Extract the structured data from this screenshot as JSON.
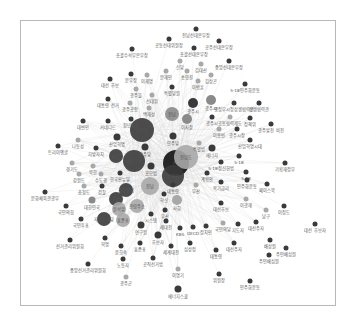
{
  "diagram": {
    "type": "network",
    "colors": {
      "dark": "#3a3a3a",
      "mid": "#8a8a8a",
      "light": "#a8a8a8",
      "black": "#111111",
      "edge": "#dcdcdc",
      "frame": "#b8b8b8"
    },
    "nodes": [
      {
        "id": "n1",
        "label": "전남선대본부장",
        "x": 196,
        "y": 29,
        "r": 2.5,
        "c": "dark"
      },
      {
        "id": "n2",
        "label": "공동선대위원장",
        "x": 169,
        "y": 39,
        "r": 2.5,
        "c": "dark"
      },
      {
        "id": "n3",
        "label": "공주선대본부장",
        "x": 219,
        "y": 41,
        "r": 2.5,
        "c": "dark"
      },
      {
        "id": "n4",
        "label": "총괄수석부본부장",
        "x": 132,
        "y": 49,
        "r": 2.5,
        "c": "dark"
      },
      {
        "id": "n5",
        "label": "총괄선대본부장",
        "x": 194,
        "y": 48,
        "r": 2.5,
        "c": "dark"
      },
      {
        "id": "n6",
        "label": "중앙선대본부장",
        "x": 229,
        "y": 61,
        "r": 2.5,
        "c": "dark"
      },
      {
        "id": "n7",
        "label": "신당",
        "x": 180,
        "y": 61,
        "r": 2.5,
        "c": "light"
      },
      {
        "id": "n8",
        "label": "김대산",
        "x": 201,
        "y": 64,
        "r": 2.5,
        "c": "light"
      },
      {
        "id": "n9",
        "label": "문재인",
        "x": 166,
        "y": 71,
        "r": 2.5,
        "c": "light"
      },
      {
        "id": "n10",
        "label": "송영길",
        "x": 187,
        "y": 71,
        "r": 2.5,
        "c": "light"
      },
      {
        "id": "n11",
        "label": "김상곤",
        "x": 211,
        "y": 75,
        "r": 2.5,
        "c": "light"
      },
      {
        "id": "n12",
        "label": "문부장",
        "x": 131,
        "y": 74,
        "r": 2.5,
        "c": "dark"
      },
      {
        "id": "n13",
        "label": "이재명",
        "x": 147,
        "y": 75,
        "r": 2.5,
        "c": "light"
      },
      {
        "id": "n14",
        "label": "대선 후보",
        "x": 110,
        "y": 79,
        "r": 2.5,
        "c": "dark"
      },
      {
        "id": "n15",
        "label": "이병훈",
        "x": 198,
        "y": 81,
        "r": 2.5,
        "c": "light"
      },
      {
        "id": "n16",
        "label": "특별당원",
        "x": 172,
        "y": 87,
        "r": 2.5,
        "c": "dark"
      },
      {
        "id": "n17",
        "label": "5·18민주화운동",
        "x": 245,
        "y": 84,
        "r": 2.5,
        "c": "dark"
      },
      {
        "id": "n18",
        "label": "광주을",
        "x": 136,
        "y": 89,
        "r": 2.5,
        "c": "light"
      },
      {
        "id": "n19",
        "label": "대통령 선거",
        "x": 108,
        "y": 99,
        "r": 2.5,
        "c": "dark"
      },
      {
        "id": "n20",
        "label": "광주공항",
        "x": 130,
        "y": 103,
        "r": 2.5,
        "c": "light"
      },
      {
        "id": "n21",
        "label": "선대위",
        "x": 152,
        "y": 95,
        "r": 2.5,
        "c": "light"
      },
      {
        "id": "n22",
        "label": "광주시",
        "x": 193,
        "y": 103,
        "r": 5,
        "c": "dark"
      },
      {
        "id": "n23",
        "label": "광주시",
        "x": 211,
        "y": 100,
        "r": 5,
        "c": "mid"
      },
      {
        "id": "n24",
        "label": "행정부시장상생협력관",
        "x": 234,
        "y": 103,
        "r": 2.5,
        "c": "dark"
      },
      {
        "id": "n25",
        "label": "상생협력관",
        "x": 259,
        "y": 103,
        "r": 2.5,
        "c": "dark"
      },
      {
        "id": "n26",
        "label": "백재성",
        "x": 149,
        "y": 108,
        "r": 2.5,
        "c": "light"
      },
      {
        "id": "n27",
        "label": "전남",
        "x": 172,
        "y": 114,
        "r": 7,
        "c": "mid"
      },
      {
        "id": "n28",
        "label": "이사장",
        "x": 187,
        "y": 119,
        "r": 5,
        "c": "mid"
      },
      {
        "id": "n29",
        "label": "광주시",
        "x": 212,
        "y": 117,
        "r": 2.5,
        "c": "dark"
      },
      {
        "id": "n30",
        "label": "공동협력제도",
        "x": 230,
        "y": 117,
        "r": 2.5,
        "c": "light"
      },
      {
        "id": "n31",
        "label": "정책위",
        "x": 250,
        "y": 118,
        "r": 2.5,
        "c": "dark"
      },
      {
        "id": "n32",
        "label": "광주발전 비전",
        "x": 271,
        "y": 124,
        "r": 2.5,
        "c": "dark"
      },
      {
        "id": "n33",
        "label": "대변인",
        "x": 83,
        "y": 121,
        "r": 2.5,
        "c": "dark"
      },
      {
        "id": "n34",
        "label": "커네디드",
        "x": 108,
        "y": 121,
        "r": 2.5,
        "c": "dark"
      },
      {
        "id": "n35",
        "label": "청년위원",
        "x": 131,
        "y": 119,
        "r": 2.5,
        "c": "dark"
      },
      {
        "id": "n36",
        "label": "이용섭",
        "x": 142,
        "y": 130,
        "r": 12,
        "c": "dark"
      },
      {
        "id": "n37",
        "label": "광주시장",
        "x": 237,
        "y": 129,
        "r": 2.5,
        "c": "dark"
      },
      {
        "id": "n38",
        "label": "이용빈",
        "x": 219,
        "y": 129,
        "r": 2.5,
        "c": "light"
      },
      {
        "id": "n39",
        "label": "민주당",
        "x": 173,
        "y": 136,
        "r": 3.5,
        "c": "dark"
      },
      {
        "id": "n40",
        "label": "산업혁명시대",
        "x": 250,
        "y": 140,
        "r": 2.5,
        "c": "dark"
      },
      {
        "id": "n41",
        "label": "나동성",
        "x": 78,
        "y": 140,
        "r": 2.5,
        "c": "light"
      },
      {
        "id": "n42",
        "label": "산업혁명",
        "x": 117,
        "y": 137,
        "r": 3.5,
        "c": "dark"
      },
      {
        "id": "n43",
        "label": "민주당",
        "x": 145,
        "y": 147,
        "r": 3.5,
        "c": "dark"
      },
      {
        "id": "n44",
        "label": "특별법",
        "x": 199,
        "y": 143,
        "r": 2.5,
        "c": "light"
      },
      {
        "id": "n45",
        "label": "트리이앵글",
        "x": 58,
        "y": 146,
        "r": 2.5,
        "c": "dark"
      },
      {
        "id": "n46",
        "label": "지방자치",
        "x": 96,
        "y": 148,
        "r": 2.5,
        "c": "dark"
      },
      {
        "id": "n47",
        "label": "에너지",
        "x": 212,
        "y": 148,
        "r": 3.5,
        "c": "dark"
      },
      {
        "id": "n48",
        "label": "대선",
        "x": 116,
        "y": 156,
        "r": 7,
        "c": "dark"
      },
      {
        "id": "n49",
        "label": "대선후보",
        "x": 134,
        "y": 161,
        "r": 11,
        "c": "dark"
      },
      {
        "id": "n50",
        "label": "광주",
        "x": 176,
        "y": 163,
        "r": 13,
        "c": "black"
      },
      {
        "id": "n51",
        "label": "전남도",
        "x": 186,
        "y": 157,
        "r": 12,
        "c": "light"
      },
      {
        "id": "n52",
        "label": "공모법",
        "x": 151,
        "y": 166,
        "r": 3.5,
        "c": "dark"
      },
      {
        "id": "n53",
        "label": "5·18",
        "x": 239,
        "y": 156,
        "r": 2.5,
        "c": "dark"
      },
      {
        "id": "n54",
        "label": "5·18정신헌법",
        "x": 221,
        "y": 162,
        "r": 2.5,
        "c": "dark"
      },
      {
        "id": "n55",
        "label": "기획재정부",
        "x": 285,
        "y": 163,
        "r": 2.5,
        "c": "dark"
      },
      {
        "id": "n56",
        "label": "경기도",
        "x": 72,
        "y": 163,
        "r": 2.5,
        "c": "light"
      },
      {
        "id": "n57",
        "label": "북한",
        "x": 93,
        "y": 166,
        "r": 2.5,
        "c": "light"
      },
      {
        "id": "n58",
        "label": "강원도",
        "x": 79,
        "y": 174,
        "r": 2.5,
        "c": "light"
      },
      {
        "id": "n59",
        "label": "수도권",
        "x": 101,
        "y": 174,
        "r": 2.5,
        "c": "light"
      },
      {
        "id": "n60",
        "label": "한국판뉴딜",
        "x": 120,
        "y": 173,
        "r": 2.5,
        "c": "dark"
      },
      {
        "id": "n61",
        "label": "동해안",
        "x": 173,
        "y": 176,
        "r": 11,
        "c": "dark"
      },
      {
        "id": "n62",
        "label": "계획안",
        "x": 207,
        "y": 173,
        "r": 2.5,
        "c": "dark"
      },
      {
        "id": "n63",
        "label": "5·18",
        "x": 246,
        "y": 172,
        "r": 2.5,
        "c": "dark"
      },
      {
        "id": "n64",
        "label": "충청도",
        "x": 84,
        "y": 186,
        "r": 2.5,
        "c": "light"
      },
      {
        "id": "n65",
        "label": "검찰",
        "x": 102,
        "y": 186,
        "r": 2.5,
        "c": "dark"
      },
      {
        "id": "n66",
        "label": "공정경제",
        "x": 126,
        "y": 190,
        "r": 7,
        "c": "dark"
      },
      {
        "id": "n67",
        "label": "전남",
        "x": 150,
        "y": 186,
        "r": 9,
        "c": "light"
      },
      {
        "id": "n68",
        "label": "대통령",
        "x": 173,
        "y": 185,
        "r": 2.5,
        "c": "dark"
      },
      {
        "id": "n69",
        "label": "부산",
        "x": 196,
        "y": 185,
        "r": 2.5,
        "c": "light"
      },
      {
        "id": "n70",
        "label": "복기금리",
        "x": 221,
        "y": 182,
        "r": 2.5,
        "c": "dark"
      },
      {
        "id": "n71",
        "label": "민주화운동",
        "x": 247,
        "y": 180,
        "r": 2.5,
        "c": "dark"
      },
      {
        "id": "n72",
        "label": "페이스북",
        "x": 267,
        "y": 184,
        "r": 2.5,
        "c": "dark"
      },
      {
        "id": "n73",
        "label": "문화체육관광부",
        "x": 45,
        "y": 192,
        "r": 2.5,
        "c": "dark"
      },
      {
        "id": "n74",
        "label": "대한민국",
        "x": 92,
        "y": 200,
        "r": 3.5,
        "c": "mid"
      },
      {
        "id": "n75",
        "label": "국정",
        "x": 116,
        "y": 199,
        "r": 7,
        "c": "dark"
      },
      {
        "id": "n76",
        "label": "관람주소",
        "x": 137,
        "y": 206,
        "r": 7,
        "c": "light"
      },
      {
        "id": "n77",
        "label": "혁신",
        "x": 164,
        "y": 194,
        "r": 2.5,
        "c": "dark"
      },
      {
        "id": "n78",
        "label": "사회",
        "x": 177,
        "y": 200,
        "r": 5,
        "c": "light"
      },
      {
        "id": "n79",
        "label": "대선후보",
        "x": 221,
        "y": 203,
        "r": 2.5,
        "c": "dark"
      },
      {
        "id": "n80",
        "label": "이광재",
        "x": 246,
        "y": 199,
        "r": 2.5,
        "c": "light"
      },
      {
        "id": "n81",
        "label": "국민의힘",
        "x": 66,
        "y": 206,
        "r": 2.5,
        "c": "dark"
      },
      {
        "id": "n82",
        "label": "윤석열",
        "x": 119,
        "y": 209,
        "r": 7,
        "c": "light"
      },
      {
        "id": "n83",
        "label": "부산",
        "x": 165,
        "y": 210,
        "r": 2.5,
        "c": "dark"
      },
      {
        "id": "n84",
        "label": "남구",
        "x": 266,
        "y": 210,
        "r": 2.5,
        "c": "light"
      },
      {
        "id": "n85",
        "label": "이정도",
        "x": 284,
        "y": 206,
        "r": 2.5,
        "c": "dark"
      },
      {
        "id": "n86",
        "label": "국민투표",
        "x": 81,
        "y": 219,
        "r": 2.5,
        "c": "dark"
      },
      {
        "id": "n87",
        "label": "자유한국당",
        "x": 104,
        "y": 219,
        "r": 7,
        "c": "dark"
      },
      {
        "id": "n88",
        "label": "홍준표",
        "x": 123,
        "y": 220,
        "r": 7,
        "c": "light"
      },
      {
        "id": "n89",
        "label": "시스템",
        "x": 151,
        "y": 214,
        "r": 2.5,
        "c": "dark"
      },
      {
        "id": "n90",
        "label": "세대전",
        "x": 166,
        "y": 221,
        "r": 2.5,
        "c": "dark"
      },
      {
        "id": "n91",
        "label": "국민의당",
        "x": 223,
        "y": 223,
        "r": 2.5,
        "c": "light"
      },
      {
        "id": "n92",
        "label": "지도자",
        "x": 238,
        "y": 224,
        "r": 2.5,
        "c": "dark"
      },
      {
        "id": "n93",
        "label": "대선주자",
        "x": 256,
        "y": 222,
        "r": 2.5,
        "c": "dark"
      },
      {
        "id": "n94",
        "label": "대선 후보자",
        "x": 315,
        "y": 224,
        "r": 2.5,
        "c": "dark"
      },
      {
        "id": "n95",
        "label": "연구원",
        "x": 141,
        "y": 225,
        "r": 3.5,
        "c": "dark"
      },
      {
        "id": "n96",
        "label": "KBS",
        "x": 180,
        "y": 228,
        "r": 2.5,
        "c": "dark"
      },
      {
        "id": "n97",
        "label": "OECD",
        "x": 193,
        "y": 227,
        "r": 2.5,
        "c": "dark"
      },
      {
        "id": "n98",
        "label": "정치인",
        "x": 206,
        "y": 226,
        "r": 2.5,
        "c": "dark"
      },
      {
        "id": "n99",
        "label": "선거관리위원회",
        "x": 70,
        "y": 240,
        "r": 2.5,
        "c": "dark"
      },
      {
        "id": "n100",
        "label": "혁명",
        "x": 105,
        "y": 238,
        "r": 2.5,
        "c": "dark"
      },
      {
        "id": "n101",
        "label": "후보자",
        "x": 158,
        "y": 235,
        "r": 3.5,
        "c": "dark"
      },
      {
        "id": "n102",
        "label": "홍준표",
        "x": 140,
        "y": 243,
        "r": 2.5,
        "c": "dark"
      },
      {
        "id": "n103",
        "label": "윤희숙",
        "x": 121,
        "y": 246,
        "r": 2.5,
        "c": "dark"
      },
      {
        "id": "n104",
        "label": "세계대전",
        "x": 171,
        "y": 246,
        "r": 2.5,
        "c": "dark"
      },
      {
        "id": "n105",
        "label": "심상정",
        "x": 190,
        "y": 243,
        "r": 2.5,
        "c": "dark"
      },
      {
        "id": "n106",
        "label": "대선주자",
        "x": 234,
        "y": 243,
        "r": 2.5,
        "c": "dark"
      },
      {
        "id": "n107",
        "label": "배상원",
        "x": 270,
        "y": 240,
        "r": 2.5,
        "c": "dark"
      },
      {
        "id": "n108",
        "label": "대통령",
        "x": 216,
        "y": 250,
        "r": 2.5,
        "c": "dark"
      },
      {
        "id": "n109",
        "label": "주민배심원",
        "x": 286,
        "y": 248,
        "r": 2.5,
        "c": "dark"
      },
      {
        "id": "n110",
        "label": "주민배심원",
        "x": 269,
        "y": 255,
        "r": 2.5,
        "c": "dark"
      },
      {
        "id": "n111",
        "label": "노동자",
        "x": 123,
        "y": 259,
        "r": 2.5,
        "c": "dark"
      },
      {
        "id": "n112",
        "label": "공직선거법",
        "x": 153,
        "y": 258,
        "r": 2.5,
        "c": "dark"
      },
      {
        "id": "n113",
        "label": "중앙선거관리위원회",
        "x": 88,
        "y": 264,
        "r": 2.5,
        "c": "dark"
      },
      {
        "id": "n114",
        "label": "이명기",
        "x": 178,
        "y": 269,
        "r": 2.5,
        "c": "light"
      },
      {
        "id": "n115",
        "label": "위원장",
        "x": 219,
        "y": 274,
        "r": 2.5,
        "c": "dark"
      },
      {
        "id": "n116",
        "label": "민주화운동",
        "x": 250,
        "y": 281,
        "r": 2.5,
        "c": "dark"
      },
      {
        "id": "n117",
        "label": "광주군",
        "x": 126,
        "y": 277,
        "r": 2.5,
        "c": "light"
      },
      {
        "id": "n118",
        "label": "에너지스쿨",
        "x": 178,
        "y": 289,
        "r": 3.5,
        "c": "dark"
      }
    ],
    "hubs": [
      "n36",
      "n49",
      "n50",
      "n51",
      "n61",
      "n67"
    ]
  }
}
